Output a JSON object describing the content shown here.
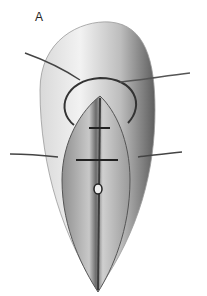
{
  "figure": {
    "panel_label": "A",
    "colors": {
      "background": "#ffffff",
      "tissue_light": "#e6e6e6",
      "tissue_mid": "#b5b5b5",
      "tissue_dark": "#6e6e6e",
      "incision_surface": "#a9a9a9",
      "suture": "#333333"
    }
  }
}
